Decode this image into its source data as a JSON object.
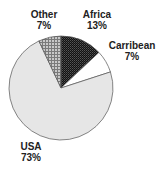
{
  "chart_data": {
    "type": "pie",
    "title": "",
    "start_angle_deg": 0,
    "direction": "clockwise",
    "slices": [
      {
        "name": "Africa",
        "value": 13,
        "label": "Africa",
        "pct_label": "13%",
        "fill": "pattern-dark-checker",
        "color": "#1a1a1a"
      },
      {
        "name": "Carribean",
        "value": 7,
        "label": "Carribean",
        "pct_label": "7%",
        "fill": "solid",
        "color": "#ffffff"
      },
      {
        "name": "USA",
        "value": 73,
        "label": "USA",
        "pct_label": "73%",
        "fill": "solid",
        "color": "#e6e6e6"
      },
      {
        "name": "Other",
        "value": 7,
        "label": "Other",
        "pct_label": "7%",
        "fill": "pattern-grey-grid",
        "color": "#9a9a9a"
      }
    ],
    "legend": "none (direct labels)"
  },
  "geometry": {
    "cx": 61,
    "cy": 88,
    "r": 52
  },
  "labels": {
    "africa": {
      "name": "Africa",
      "pct": "13%"
    },
    "carribean": {
      "name": "Carribean",
      "pct": "7%"
    },
    "usa": {
      "name": "USA",
      "pct": "73%"
    },
    "other": {
      "name": "Other",
      "pct": "7%"
    }
  }
}
